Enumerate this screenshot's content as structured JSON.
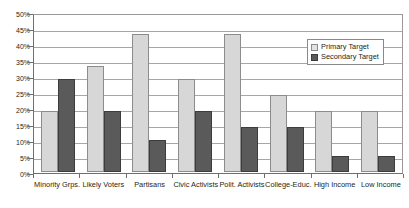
{
  "chart_data": {
    "type": "bar",
    "title": "",
    "xlabel": "",
    "ylabel": "",
    "ylim": [
      0,
      50
    ],
    "ytick_labels": [
      "50%",
      "45%",
      "40%",
      "35%",
      "30%",
      "25%",
      "20%",
      "15%",
      "10%",
      "5%",
      "0%"
    ],
    "ytick_values": [
      50,
      45,
      40,
      35,
      30,
      25,
      20,
      15,
      10,
      5,
      0
    ],
    "grid": true,
    "legend_position": "top-right",
    "categories": [
      "Minority Grps.",
      "Likely Voters",
      "Partisans",
      "Civic Activists",
      "Polit. Activists",
      "College-Educ.",
      "High Income",
      "Low Income"
    ],
    "series": [
      {
        "name": "Primary Target",
        "color": "#d7d7d7",
        "values": [
          19,
          33,
          43,
          29,
          43,
          24,
          19,
          19
        ]
      },
      {
        "name": "Secondary Target",
        "color": "#5a5a5a",
        "values": [
          29,
          19,
          10,
          19,
          14,
          14,
          5,
          5
        ]
      }
    ]
  },
  "legend": {
    "items": [
      {
        "label": "Primary Target"
      },
      {
        "label": "Secondary Target"
      }
    ]
  }
}
